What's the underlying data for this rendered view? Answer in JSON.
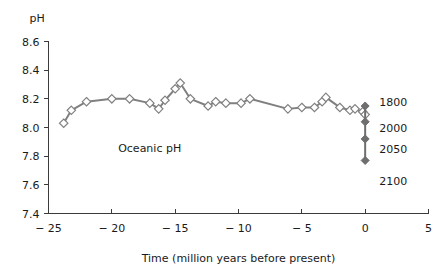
{
  "chart_data": {
    "type": "line",
    "title": "",
    "xlabel": "Time (million years before present)",
    "ylabel": "pH",
    "xlim": [
      -25,
      5
    ],
    "ylim": [
      7.4,
      8.6
    ],
    "grid": false,
    "legend_position": "none",
    "xticks": [
      "− 25",
      "− 20",
      "− 15",
      "− 10",
      "− 5",
      "0",
      "5"
    ],
    "xtick_values": [
      -25,
      -20,
      -15,
      -10,
      -5,
      0,
      5
    ],
    "yticks": [
      "8.6",
      "8.4",
      "8.2",
      "8.0",
      "7.8",
      "7.6",
      "7.4"
    ],
    "ytick_values": [
      8.6,
      8.4,
      8.2,
      8.0,
      7.8,
      7.6,
      7.4
    ],
    "annotations": [
      {
        "text": "Oceanic pH",
        "x": -19.5,
        "y": 7.83
      }
    ],
    "series": [
      {
        "name": "Oceanic pH",
        "marker": "open-diamond",
        "color": "#808080",
        "x": [
          -23.8,
          -23.2,
          -22.0,
          -20.0,
          -18.6,
          -17.0,
          -16.3,
          -15.8,
          -15.0,
          -14.6,
          -13.8,
          -12.4,
          -11.8,
          -11.0,
          -9.8,
          -9.1,
          -6.1,
          -5.0,
          -4.0,
          -3.4,
          -3.1,
          -2.0,
          -1.2,
          -0.8,
          -0.2,
          0.0
        ],
        "y": [
          8.03,
          8.12,
          8.18,
          8.2,
          8.2,
          8.17,
          8.13,
          8.19,
          8.27,
          8.31,
          8.2,
          8.15,
          8.18,
          8.17,
          8.17,
          8.2,
          8.13,
          8.14,
          8.14,
          8.18,
          8.21,
          8.14,
          8.12,
          8.13,
          8.11,
          8.09
        ]
      }
    ],
    "projection": {
      "name": "Future projection",
      "x": 0,
      "marker": "filled-diamond",
      "color": "#6e6e6e",
      "points": [
        {
          "label": "1800",
          "ph": 8.15
        },
        {
          "label": "2000",
          "ph": 8.04
        },
        {
          "label": "2050",
          "ph": 7.92
        },
        {
          "label": "2100",
          "ph": 7.77
        }
      ],
      "label_ph_positions": [
        8.18,
        8.0,
        7.85,
        7.63
      ]
    }
  }
}
